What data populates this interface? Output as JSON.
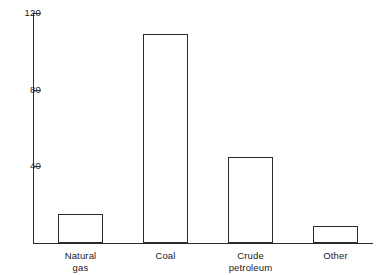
{
  "chart_data": {
    "type": "bar",
    "title": "",
    "subtitle": "",
    "xlabel": "",
    "ylabel": "",
    "categories": [
      "Natural\ngas",
      "Coal",
      "Crude\npetroleum",
      "Other"
    ],
    "category_labels_flat": [
      "Natural gas",
      "Coal",
      "Crude petroleum",
      "Other"
    ],
    "values": [
      15,
      109,
      45,
      9
    ],
    "ylim": [
      0,
      120
    ],
    "yticks": [
      40,
      80,
      120
    ],
    "ytick_labels": [
      "40",
      "80",
      "120"
    ],
    "grid": false,
    "legend": false,
    "bar_style": {
      "fill": "#ffffff",
      "outline": "#2b2b2b"
    },
    "axis_color": "#2b2b2b"
  }
}
